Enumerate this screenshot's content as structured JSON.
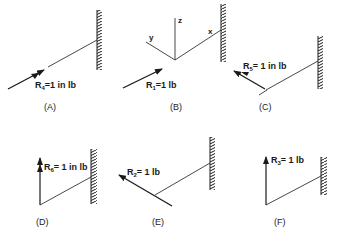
{
  "panels": [
    {
      "id": "A",
      "caption": "(A)",
      "label_main": "R",
      "label_sub": "4",
      "label_rest": "=1 in lb",
      "load_type": "moment",
      "direction": "along beam"
    },
    {
      "id": "B",
      "caption": "(B)",
      "label_main": "R",
      "label_sub": "1",
      "label_rest": "=1 lb",
      "load_type": "force",
      "direction": "along beam",
      "axes": {
        "x": "x",
        "y": "y",
        "z": "z"
      }
    },
    {
      "id": "C",
      "caption": "(C)",
      "label_main": "R",
      "label_sub": "5",
      "label_rest": "= 1 in lb",
      "load_type": "moment",
      "direction": "y"
    },
    {
      "id": "D",
      "caption": "(D)",
      "label_main": "R",
      "label_sub": "6",
      "label_rest": "= 1 in lb",
      "load_type": "moment",
      "direction": "z"
    },
    {
      "id": "E",
      "caption": "(E)",
      "label_main": "R",
      "label_sub": "2",
      "label_rest": "= 1 lb",
      "load_type": "force",
      "direction": "y"
    },
    {
      "id": "F",
      "caption": "(F)",
      "label_main": "R",
      "label_sub": "3",
      "label_rest": "= 1 lb",
      "load_type": "force",
      "direction": "z"
    }
  ],
  "colors": {
    "ink": "#1a1a1a",
    "background": "#ffffff"
  }
}
